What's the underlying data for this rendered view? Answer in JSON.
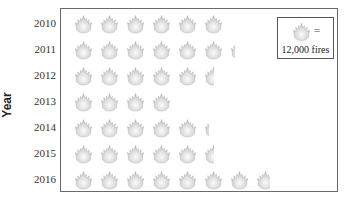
{
  "chart_data": {
    "type": "pictograph",
    "title": "",
    "ylabel": "Year",
    "xlabel": "",
    "unit_value": 12000,
    "unit_label": "fires",
    "categories": [
      "2010",
      "2011",
      "2012",
      "2013",
      "2014",
      "2015",
      "2016"
    ],
    "icons": [
      6,
      6.25,
      5.5,
      4,
      5.25,
      5.5,
      7.75
    ],
    "values": [
      72000,
      75000,
      66000,
      48000,
      63000,
      66000,
      93000
    ],
    "legend": {
      "icon": "flame-icon",
      "equals": "=",
      "text": "12,000 fires",
      "position": "top-right"
    },
    "grid": false
  },
  "colors": {
    "flame_light": "#f2f2f2",
    "flame_dark": "#a8a8a8",
    "frame": "#6a6a6a"
  }
}
